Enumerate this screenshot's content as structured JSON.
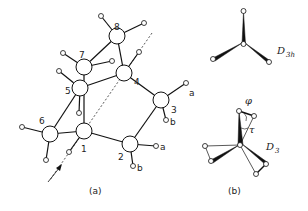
{
  "figure": {
    "panel_a": {
      "label": "(a)",
      "atoms": [
        "1",
        "2",
        "3",
        "4",
        "5",
        "6",
        "7",
        "8"
      ],
      "hydrogen_labels": {
        "a3": "a",
        "b3": "b",
        "a2": "a",
        "b2": "b"
      }
    },
    "panel_b": {
      "label": "(b)",
      "top_symmetry": "D",
      "top_sub": "3h",
      "bottom_symmetry": "D",
      "bottom_sub": "3",
      "phi": "φ",
      "tau": "τ"
    }
  }
}
